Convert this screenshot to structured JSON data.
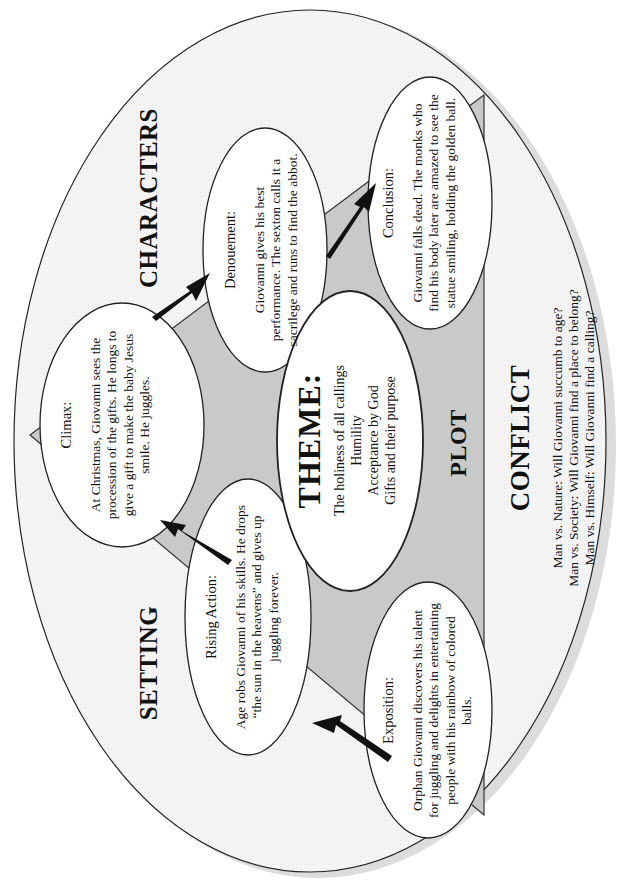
{
  "diagram": {
    "type": "story-map",
    "orientation": "rotated-90-ccw",
    "colors": {
      "background": "#ffffff",
      "outer_oval_fill": "#f2f2f2",
      "outer_oval_shadow": "#dcdcdc",
      "plot_triangle_fill": "#c8c8c8",
      "ellipse_fill": "#ffffff",
      "stroke": "#222222",
      "arrow": "#111111",
      "text": "#111111"
    },
    "section_labels": {
      "setting": "SETTING",
      "characters": "CHARACTERS",
      "plot": "PLOT",
      "conflict": "CONFLICT"
    },
    "plot_points": [
      {
        "id": "exposition",
        "title": "Exposition:",
        "text": "Orphan Giovanni discovers his talent for juggling and delights in entertaining people with his rainbow of colored balls."
      },
      {
        "id": "rising-action",
        "title": "Rising Action:",
        "text": "Age robs Giovanni of his skills. He drops “the sun in the heavens” and gives up juggling forever."
      },
      {
        "id": "climax",
        "title": "Climax:",
        "text": "At Christmas, Giovanni sees the procession of the gifts. He longs to give a gift to make the baby Jesus smile. He juggles."
      },
      {
        "id": "denouement",
        "title": "Denouement:",
        "text": "Giovanni gives his best performance. The sexton calls it a sacrilege and runs to find the abbot."
      },
      {
        "id": "conclusion",
        "title": "Conclusion:",
        "text": "Giovanni falls dead. The monks who find his body later are amazed to see the statue smiling, holding the golden ball."
      }
    ],
    "theme": {
      "title": "THEME:",
      "lines": [
        "The holiness of all callings",
        "Humility",
        "Acceptance by God",
        "Gifts and their purpose"
      ]
    },
    "conflict": {
      "lines": [
        "Man vs. Nature: Will Giovanni succumb to age?",
        "Man vs. Society: Will Giovanni find a place to belong?",
        "Man vs. Himself: Will Giovanni find a calling?"
      ]
    }
  }
}
